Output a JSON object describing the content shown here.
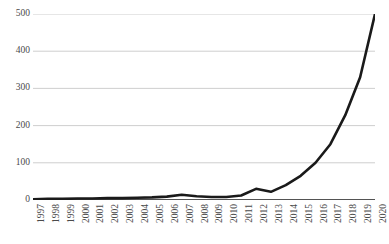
{
  "chart_data": {
    "type": "line",
    "title": "",
    "subtitle": "",
    "xlabel": "",
    "ylabel": "",
    "categories": [
      "1997",
      "1998",
      "1999",
      "2000",
      "2001",
      "2002",
      "2003",
      "2004",
      "2005",
      "2006",
      "2007",
      "2008",
      "2009",
      "2010",
      "2011",
      "2012",
      "2013",
      "2014",
      "2015",
      "2016",
      "2017",
      "2018",
      "2019",
      "2020"
    ],
    "values": [
      2,
      3,
      3,
      4,
      4,
      5,
      5,
      6,
      7,
      9,
      14,
      10,
      8,
      8,
      12,
      30,
      22,
      40,
      65,
      100,
      150,
      228,
      330,
      500
    ],
    "ylim": [
      0,
      500
    ],
    "yticks": [
      0,
      100,
      200,
      300,
      400,
      500
    ],
    "ytick_labels": [
      "0",
      "100",
      "200",
      "300",
      "400",
      "500"
    ],
    "grid": true,
    "legend": false,
    "legend_position": "none",
    "series": [
      {
        "name": "",
        "values": [
          2,
          3,
          3,
          4,
          4,
          5,
          5,
          6,
          7,
          9,
          14,
          10,
          8,
          8,
          12,
          30,
          22,
          40,
          65,
          100,
          150,
          228,
          330,
          500
        ]
      }
    ],
    "colors": {
      "line": "#1a1a1a",
      "grid": "#c8c8c8",
      "axis": "#1a1a1a",
      "tick_text": "#4a4a4a",
      "background": "#ffffff"
    },
    "line_width": 2.6
  }
}
